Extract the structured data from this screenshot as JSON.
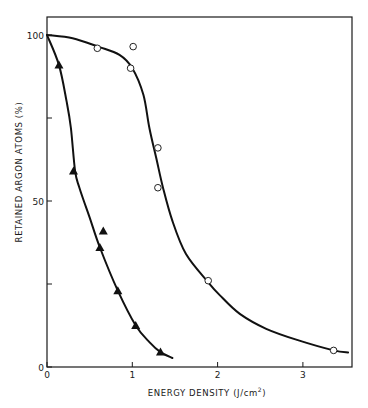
{
  "chart_data": {
    "type": "scatter",
    "title": "",
    "xlabel": "ENERGY DENSITY (J/cm",
    "xlabel_superscript": "2",
    "xlabel_close": ")",
    "ylabel": "RETAINED ARGON ATOMS (%)",
    "xlim": [
      0,
      3.6
    ],
    "ylim": [
      0,
      105
    ],
    "x_ticks": [
      0,
      1,
      2,
      3
    ],
    "x_tick_labels": [
      "0",
      "1",
      "2",
      "3"
    ],
    "y_ticks": [
      0,
      25,
      50,
      75,
      100
    ],
    "y_tick_labels": [
      "0",
      "",
      "50",
      "",
      "100"
    ],
    "grid": false,
    "legend": null,
    "series": [
      {
        "name": "filled triangles",
        "marker": "filled-triangle",
        "points": [
          {
            "x": 0.14,
            "y": 91
          },
          {
            "x": 0.31,
            "y": 59
          },
          {
            "x": 0.62,
            "y": 36
          },
          {
            "x": 0.66,
            "y": 41
          },
          {
            "x": 0.83,
            "y": 23
          },
          {
            "x": 1.04,
            "y": 12.5
          },
          {
            "x": 1.33,
            "y": 4.5
          }
        ],
        "fit_curve": [
          [
            0,
            100
          ],
          [
            0.14,
            91
          ],
          [
            0.23,
            80
          ],
          [
            0.28,
            72
          ],
          [
            0.33,
            59
          ],
          [
            0.38,
            54
          ],
          [
            0.5,
            45
          ],
          [
            0.62,
            36
          ],
          [
            0.83,
            23
          ],
          [
            1.04,
            12.5
          ],
          [
            1.2,
            7.5
          ],
          [
            1.33,
            4.5
          ],
          [
            1.47,
            2.7
          ]
        ]
      },
      {
        "name": "open circles",
        "marker": "open-circle",
        "points": [
          {
            "x": 0.59,
            "y": 96
          },
          {
            "x": 1.01,
            "y": 96.5
          },
          {
            "x": 0.98,
            "y": 90
          },
          {
            "x": 1.3,
            "y": 66
          },
          {
            "x": 1.3,
            "y": 54
          },
          {
            "x": 1.89,
            "y": 26
          },
          {
            "x": 3.36,
            "y": 5
          }
        ],
        "fit_curve": [
          [
            0,
            100
          ],
          [
            0.3,
            99
          ],
          [
            0.6,
            96.5
          ],
          [
            0.85,
            94
          ],
          [
            1.0,
            90
          ],
          [
            1.13,
            82
          ],
          [
            1.2,
            72
          ],
          [
            1.28,
            63
          ],
          [
            1.36,
            54
          ],
          [
            1.47,
            44
          ],
          [
            1.63,
            34
          ],
          [
            1.89,
            25.5
          ],
          [
            2.03,
            21.5
          ],
          [
            2.26,
            16
          ],
          [
            2.57,
            11.5
          ],
          [
            2.95,
            8
          ],
          [
            3.36,
            5
          ],
          [
            3.53,
            4.4
          ]
        ]
      }
    ]
  }
}
